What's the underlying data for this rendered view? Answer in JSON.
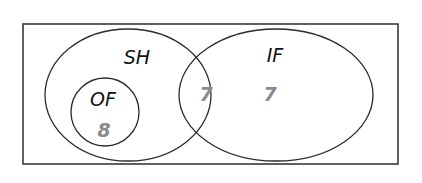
{
  "diagram": {
    "type": "venn",
    "universe": {
      "label": ""
    },
    "sets": [
      {
        "id": "SH",
        "label": "SH"
      },
      {
        "id": "IF",
        "label": "IF"
      },
      {
        "id": "OF",
        "label": "OF",
        "subset_of": "SH"
      }
    ],
    "regions": {
      "of_only": {
        "sets": [
          "SH",
          "OF"
        ],
        "value": "8"
      },
      "sh_and_if": {
        "sets": [
          "SH",
          "IF"
        ],
        "value": "7"
      },
      "if_only": {
        "sets": [
          "IF"
        ],
        "value": "7"
      }
    },
    "colors": {
      "outline": "#2a2a2a",
      "label_text": "#111111",
      "count_text": "#8a8a8a",
      "background": "#ffffff"
    }
  }
}
